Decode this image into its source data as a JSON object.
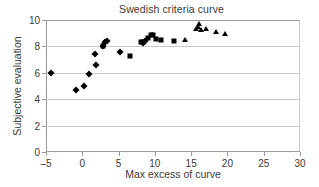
{
  "chart_data": {
    "type": "scatter",
    "title": "Swedish criteria curve",
    "xlabel": "Max excess of curve",
    "ylabel": "Subjective evaluation",
    "xlim": [
      -5,
      30
    ],
    "ylim": [
      0,
      10
    ],
    "xticks": [
      -5,
      0,
      5,
      10,
      15,
      20,
      25,
      30
    ],
    "xtick_labels": [
      "–5",
      "0",
      "5",
      "10",
      "15",
      "20",
      "25",
      "30"
    ],
    "yticks": [
      0,
      2,
      4,
      6,
      8,
      10
    ],
    "ytick_labels": [
      "0",
      "2",
      "4",
      "6",
      "8",
      "10"
    ],
    "grid": "horizontal",
    "legend": "none",
    "series": [
      {
        "name": "diamonds",
        "marker": "diamond",
        "color": "#000000",
        "points": [
          {
            "x": -4.3,
            "y": 6.0
          },
          {
            "x": -0.8,
            "y": 4.7
          },
          {
            "x": 0.3,
            "y": 5.0
          },
          {
            "x": 0.9,
            "y": 5.9
          },
          {
            "x": 1.7,
            "y": 7.4
          },
          {
            "x": 1.9,
            "y": 6.6
          },
          {
            "x": 2.8,
            "y": 8.0
          },
          {
            "x": 3.1,
            "y": 8.3
          },
          {
            "x": 3.4,
            "y": 8.4
          },
          {
            "x": 5.2,
            "y": 7.55
          },
          {
            "x": 8.3,
            "y": 8.25
          },
          {
            "x": 8.6,
            "y": 8.4
          }
        ]
      },
      {
        "name": "squares",
        "marker": "square",
        "color": "#000000",
        "points": [
          {
            "x": 2.9,
            "y": 8.05
          },
          {
            "x": 6.6,
            "y": 7.3
          },
          {
            "x": 8.1,
            "y": 8.3
          },
          {
            "x": 8.4,
            "y": 8.35
          },
          {
            "x": 9.0,
            "y": 8.6
          },
          {
            "x": 9.4,
            "y": 8.85
          },
          {
            "x": 9.7,
            "y": 8.85
          },
          {
            "x": 10.2,
            "y": 8.55
          },
          {
            "x": 10.8,
            "y": 8.45
          },
          {
            "x": 12.6,
            "y": 8.4
          }
        ]
      },
      {
        "name": "triangles",
        "marker": "triangle",
        "color": "#000000",
        "points": [
          {
            "x": 9.6,
            "y": 8.9
          },
          {
            "x": 14.1,
            "y": 8.45
          },
          {
            "x": 15.7,
            "y": 9.3
          },
          {
            "x": 15.9,
            "y": 9.45
          },
          {
            "x": 16.1,
            "y": 9.7
          },
          {
            "x": 16.4,
            "y": 9.25
          },
          {
            "x": 17.1,
            "y": 9.3
          },
          {
            "x": 18.4,
            "y": 9.1
          },
          {
            "x": 19.7,
            "y": 8.95
          }
        ]
      }
    ]
  }
}
